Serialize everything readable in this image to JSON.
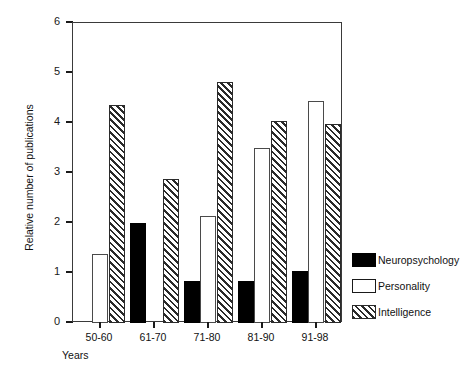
{
  "chart_data": {
    "type": "bar",
    "title": "",
    "subtitle": "",
    "xlabel": "Years",
    "ylabel": "Relative number of publications",
    "categories": [
      "50-60",
      "61-70",
      "71-80",
      "81-90",
      "91-98"
    ],
    "series": [
      {
        "name": "Neuropsychology",
        "style": "solid-black",
        "color": "#000000",
        "values": [
          0,
          2.0,
          0.84,
          0.84,
          1.05
        ]
      },
      {
        "name": "Personality",
        "style": "white-outline",
        "color": "#ffffff",
        "values": [
          1.38,
          0,
          2.14,
          3.5,
          4.45
        ]
      },
      {
        "name": "Intelligence",
        "style": "diagonal-hatch",
        "color": "#2a2a2a",
        "values": [
          4.36,
          2.88,
          4.82,
          4.05,
          3.98
        ]
      }
    ],
    "ylim": [
      0,
      6
    ],
    "yticks": [
      0,
      1,
      2,
      3,
      4,
      5,
      6
    ],
    "ytick_labels": [
      "0",
      "1",
      "2",
      "3",
      "4",
      "5",
      "6"
    ],
    "grid": false,
    "legend_position": "right-bottom"
  },
  "legend": {
    "entries": [
      {
        "label": "Neuropsychology"
      },
      {
        "label": "Personality"
      },
      {
        "label": "Intelligence"
      }
    ]
  }
}
